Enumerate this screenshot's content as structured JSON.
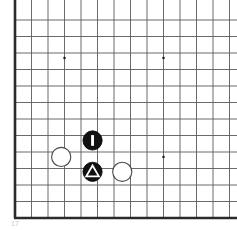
{
  "diagram": {
    "kind": "go-board-diagram",
    "board": {
      "origin_x": 15,
      "origin_y": 20,
      "cell": 16.5,
      "cols": 13,
      "rows": 12,
      "line_color": "#5a5a5a",
      "line_width": 0.9,
      "edge_color": "#2b2b2b",
      "edge_width": 2.6,
      "background": "#ffffff",
      "left_edge_label": "board-left-boundary",
      "bottom_edge_label": "board-bottom-boundary"
    },
    "star_points": [
      {
        "name": "star-point-upper-left",
        "col": 3,
        "row": 2.3,
        "size": 2.2
      },
      {
        "name": "star-point-upper-right",
        "col": 9,
        "row": 2.3,
        "size": 2.2
      },
      {
        "name": "star-point-lower-right",
        "col": 9,
        "row": 8.3,
        "size": 2.2
      }
    ],
    "stones": [
      {
        "name": "black-stone-marked-bar",
        "color": "black",
        "fill": "#111111",
        "stroke": "#000000",
        "col": 4.7,
        "row": 7.3,
        "radius": 9.6,
        "mark": "bar",
        "mark_color": "#ffffff",
        "label": "Black 1 (rectangle mark)"
      },
      {
        "name": "black-stone-marked-triangle",
        "color": "black",
        "fill": "#111111",
        "stroke": "#000000",
        "col": 4.7,
        "row": 9.2,
        "radius": 9.6,
        "mark": "triangle",
        "mark_color": "#ffffff",
        "label": "Black (triangle mark)"
      },
      {
        "name": "white-stone-left",
        "color": "white",
        "fill": "#ffffff",
        "stroke": "#4a4a4a",
        "col": 2.8,
        "row": 8.3,
        "radius": 9.6,
        "mark": "none",
        "mark_color": "",
        "label": "White stone"
      },
      {
        "name": "white-stone-right",
        "color": "white",
        "fill": "#ffffff",
        "stroke": "#4a4a4a",
        "col": 6.5,
        "row": 9.2,
        "radius": 9.6,
        "mark": "none",
        "mark_color": "",
        "label": "White stone"
      }
    ],
    "caption": {
      "text": "17",
      "color": "#c9c9c9"
    }
  }
}
